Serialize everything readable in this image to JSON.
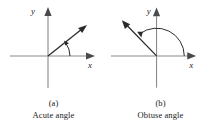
{
  "figure": {
    "background_color": "#ffffff",
    "axis_color": "#8a8a8a",
    "ray_color": "#2a2a2a",
    "arc_color": "#2a2a2a",
    "text_color": "#1a1a1a"
  },
  "panels": [
    {
      "id": "a",
      "label": "(a)",
      "name": "Acute angle",
      "x_axis_label": "x",
      "y_axis_label": "y",
      "angle_type": "acute",
      "angle_degrees_approx": 38,
      "arc_size": "small",
      "arc_direction": "counterclockwise",
      "ray_direction": "upper-right"
    },
    {
      "id": "b",
      "label": "(b)",
      "name": "Obtuse angle",
      "x_axis_label": "x",
      "y_axis_label": "y",
      "angle_type": "obtuse",
      "angle_degrees_approx": 135,
      "arc_size": "large",
      "arc_direction": "counterclockwise",
      "ray_direction": "upper-left"
    }
  ]
}
